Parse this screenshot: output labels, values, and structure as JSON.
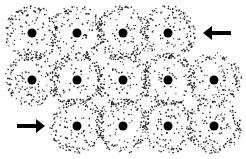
{
  "diagram": {
    "type": "atomic-lattice-dislocation",
    "background": "#fdfdfd",
    "dot_color": "#222222",
    "nucleus_color": "#000000",
    "arrow_color": "#000000",
    "cloud_radius": 27,
    "nucleus_radius": 4.5,
    "atoms": [
      {
        "row": 1,
        "x": 32,
        "y": 33
      },
      {
        "row": 1,
        "x": 77,
        "y": 33
      },
      {
        "row": 1,
        "x": 123,
        "y": 33
      },
      {
        "row": 1,
        "x": 168,
        "y": 33
      },
      {
        "row": 2,
        "x": 32,
        "y": 80
      },
      {
        "row": 2,
        "x": 77,
        "y": 80
      },
      {
        "row": 2,
        "x": 123,
        "y": 80
      },
      {
        "row": 2,
        "x": 168,
        "y": 80
      },
      {
        "row": 2,
        "x": 214,
        "y": 80
      },
      {
        "row": 3,
        "x": 77,
        "y": 126
      },
      {
        "row": 3,
        "x": 123,
        "y": 126
      },
      {
        "row": 3,
        "x": 168,
        "y": 126
      },
      {
        "row": 3,
        "x": 214,
        "y": 126
      }
    ],
    "arrows": [
      {
        "name": "top-arrow-left",
        "direction": "left",
        "x1": 231,
        "x2": 203,
        "y": 33
      },
      {
        "name": "bottom-arrow-right",
        "direction": "right",
        "x1": 17,
        "x2": 45,
        "y": 126
      }
    ]
  }
}
